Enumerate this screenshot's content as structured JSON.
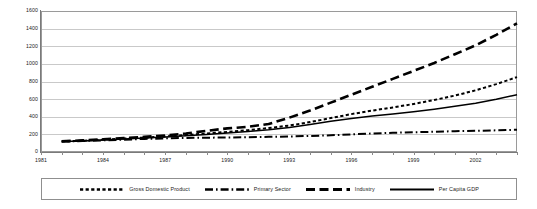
{
  "chart_data": {
    "type": "line",
    "title": "",
    "subtitle": "",
    "xlabel": "",
    "ylabel": "",
    "xlim": [
      1981,
      2004
    ],
    "ylim": [
      0,
      1600
    ],
    "grid": true,
    "legend_position": "bottom",
    "ytick_labels": [
      "1600",
      "1400",
      "1200",
      "1000",
      "800",
      "600",
      "400",
      "200",
      "0"
    ],
    "ytick_values": [
      1600,
      1400,
      1200,
      1000,
      800,
      600,
      400,
      200,
      0
    ],
    "xtick_labels": [
      "1981",
      "1984",
      "1987",
      "1990",
      "1993",
      "1996",
      "1999",
      "2002"
    ],
    "xtick_values": [
      1981,
      1984,
      1987,
      1990,
      1993,
      1996,
      1999,
      2002
    ],
    "x": [
      1982,
      1983,
      1984,
      1985,
      1986,
      1987,
      1988,
      1989,
      1990,
      1991,
      1992,
      1993,
      1994,
      1995,
      1996,
      1997,
      1998,
      1999,
      2000,
      2001,
      2002,
      2003,
      2004
    ],
    "series": [
      {
        "name": "Gross Domestic Product",
        "style": "dotted",
        "color": "#000000",
        "values": [
          120,
          128,
          140,
          152,
          163,
          176,
          192,
          210,
          228,
          248,
          272,
          300,
          340,
          385,
          430,
          470,
          505,
          545,
          590,
          640,
          700,
          770,
          850
        ]
      },
      {
        "name": "Primary Sector",
        "style": "dash-dot",
        "color": "#000000",
        "values": [
          118,
          124,
          132,
          140,
          148,
          155,
          160,
          162,
          165,
          168,
          172,
          176,
          182,
          190,
          200,
          210,
          218,
          224,
          230,
          236,
          240,
          246,
          252
        ]
      },
      {
        "name": "Industry",
        "style": "dashed",
        "color": "#000000",
        "values": [
          122,
          132,
          145,
          158,
          172,
          188,
          210,
          240,
          268,
          285,
          318,
          390,
          470,
          560,
          650,
          740,
          830,
          920,
          1010,
          1110,
          1210,
          1330,
          1460
        ]
      },
      {
        "name": "Per Capita GDP",
        "style": "solid",
        "color": "#000000",
        "values": [
          118,
          126,
          136,
          147,
          158,
          170,
          184,
          200,
          216,
          232,
          252,
          278,
          312,
          348,
          380,
          408,
          432,
          458,
          486,
          518,
          552,
          598,
          650
        ]
      }
    ]
  },
  "legend": {
    "items": [
      {
        "label": "Gross Domestic Product",
        "swatch": "dotted-line-swatch"
      },
      {
        "label": "Primary Sector",
        "swatch": "dash-dot-line-swatch"
      },
      {
        "label": "Industry",
        "swatch": "dashed-line-swatch"
      },
      {
        "label": "Per Capita GDP",
        "swatch": "solid-line-swatch"
      }
    ]
  }
}
